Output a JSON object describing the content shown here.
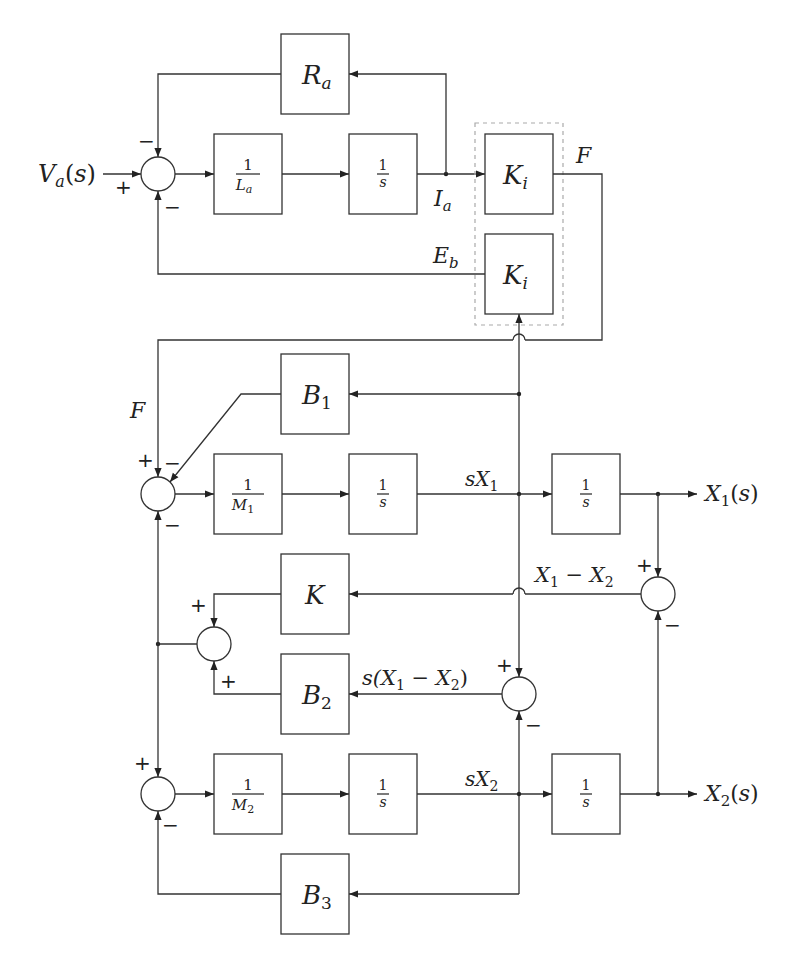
{
  "blocks": {
    "Ra": {
      "label": "R",
      "sub": "a"
    },
    "inv_La": {
      "num": "1",
      "den": "L",
      "den_sub": "a"
    },
    "int_top": {
      "num": "1",
      "den": "s"
    },
    "Ki_top": {
      "label": "K",
      "sub": "i"
    },
    "Ki_bottom": {
      "label": "K",
      "sub": "i"
    },
    "B1": {
      "label": "B",
      "sub": "1"
    },
    "inv_M1": {
      "num": "1",
      "den": "M",
      "den_sub": "1"
    },
    "int_m1_a": {
      "num": "1",
      "den": "s"
    },
    "int_m1_b": {
      "num": "1",
      "den": "s"
    },
    "K": {
      "label": "K"
    },
    "B2": {
      "label": "B",
      "sub": "2"
    },
    "inv_M2": {
      "num": "1",
      "den": "M",
      "den_sub": "2"
    },
    "int_m2_a": {
      "num": "1",
      "den": "s"
    },
    "int_m2_b": {
      "num": "1",
      "den": "s"
    },
    "B3": {
      "label": "B",
      "sub": "3"
    }
  },
  "signals": {
    "input": {
      "main": "V",
      "sub": "a",
      "tail": "(s)"
    },
    "Ia": {
      "main": "I",
      "sub": "a"
    },
    "Eb": {
      "main": "E",
      "sub": "b"
    },
    "F_top": "F",
    "F_left": "F",
    "sX1": {
      "main": "sX",
      "sub": "1"
    },
    "sX2": {
      "main": "sX",
      "sub": "2"
    },
    "X1_out": {
      "main": "X",
      "sub": "1",
      "tail": "(s)"
    },
    "X2_out": {
      "main": "X",
      "sub": "2",
      "tail": "(s)"
    },
    "X1_minus_X2": {
      "a": "X",
      "a_sub": "1",
      "op": " − ",
      "b": "X",
      "b_sub": "2"
    },
    "s_X1_minus_X2": {
      "pre": "s(",
      "a": "X",
      "a_sub": "1",
      "op": " − ",
      "b": "X",
      "b_sub": "2",
      "post": ")"
    }
  },
  "summers": {
    "top": {
      "signs": [
        "+",
        "−",
        "−"
      ]
    },
    "m1": {
      "signs": [
        "+",
        "−",
        "−"
      ]
    },
    "spring_damper": {
      "signs": [
        "+",
        "+"
      ]
    },
    "m2": {
      "signs": [
        "+",
        "−"
      ]
    },
    "pos_diff": {
      "signs": [
        "+",
        "−"
      ]
    },
    "vel_diff": {
      "signs": [
        "+",
        "−"
      ]
    }
  },
  "colors": {
    "line": "#333333",
    "text": "#222222",
    "dashed_group": "#aaaaaa",
    "background": "#ffffff"
  }
}
